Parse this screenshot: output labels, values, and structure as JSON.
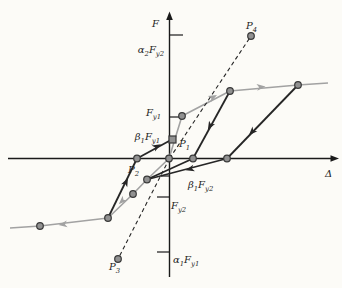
{
  "labels": {
    "axis_f": "F",
    "axis_delta": "Δ",
    "alpha2_fy2": {
      "a": "α",
      "as": "2",
      "b": "F",
      "bs": "y2"
    },
    "fy1": {
      "b": "F",
      "bs": "y1"
    },
    "beta1_fy1": {
      "a": "β",
      "as": "1",
      "b": "F",
      "bs": "y1"
    },
    "beta1_fy2": {
      "a": "β",
      "as": "1",
      "b": "F",
      "bs": "y2"
    },
    "fy2": {
      "b": "F",
      "bs": "y2"
    },
    "alpha1_fy1": {
      "a": "α",
      "as": "1",
      "b": "F",
      "bs": "y1"
    },
    "p1": {
      "main": "P",
      "sub": "1"
    },
    "p2": {
      "main": "P",
      "sub": "2"
    },
    "p3": {
      "main": "P",
      "sub": "3"
    },
    "p4": {
      "main": "P",
      "sub": "4"
    }
  },
  "figure": {
    "background": "#fcfbf7",
    "axis_color": "#1a1a1a",
    "curve_dark_color": "#262626",
    "curve_gray_color": "#a2a2a2",
    "marker_fill": "#919191",
    "marker_stroke": "#383838",
    "x_axis": {
      "x1": 8,
      "y1": 158.5,
      "x2": 332,
      "y2": 158.5,
      "head": "M339,158.5 L330.5,155.2 L330.5,161.8 Z"
    },
    "y_axis": {
      "x1": 169.5,
      "y1": 277,
      "x2": 169.5,
      "y2": 20,
      "head": "M169.5,11.5 L166.2,20 L172.8,20 Z"
    },
    "ticks": [
      [
        169.5,
        35,
        183,
        35
      ],
      [
        169.5,
        117,
        180,
        117
      ],
      [
        169.5,
        138,
        175.5,
        138
      ],
      [
        161,
        176,
        169.5,
        176
      ],
      [
        157,
        197,
        169.5,
        197
      ],
      [
        157,
        252,
        169.5,
        252
      ]
    ],
    "polylines": [
      {
        "name": "backbone-curve",
        "color": "gray",
        "width": 1.6,
        "dash": "",
        "points": [
          [
            10,
            228
          ],
          [
            40,
            226
          ],
          [
            108,
            218
          ],
          [
            133,
            194
          ],
          [
            147,
            179.5
          ],
          [
            169,
            158.5
          ],
          [
            182,
            116
          ],
          [
            230,
            91
          ],
          [
            298,
            85
          ],
          [
            328,
            83
          ]
        ]
      },
      {
        "name": "secant-line-positive",
        "color": "dark",
        "width": 1.1,
        "dash": "4 3",
        "points": [
          [
            169.5,
            158.5
          ],
          [
            251,
            36
          ]
        ]
      },
      {
        "name": "secant-line-negative",
        "color": "dark",
        "width": 1.1,
        "dash": "4 3",
        "points": [
          [
            169.5,
            158.5
          ],
          [
            118,
            259
          ]
        ]
      },
      {
        "name": "unload-path-1",
        "color": "dark",
        "width": 1.8,
        "dash": "",
        "points": [
          [
            230,
            91
          ],
          [
            193,
            158.5
          ]
        ]
      },
      {
        "name": "reverse-path-1",
        "color": "dark",
        "width": 1.8,
        "dash": "",
        "points": [
          [
            193,
            158.5
          ],
          [
            147,
            179.5
          ]
        ]
      },
      {
        "name": "unload-path-2",
        "color": "dark",
        "width": 1.8,
        "dash": "",
        "points": [
          [
            298,
            85
          ],
          [
            227,
            158.5
          ]
        ]
      },
      {
        "name": "reverse-path-2",
        "color": "dark",
        "width": 1.8,
        "dash": "",
        "points": [
          [
            227,
            158.5
          ],
          [
            147,
            179.5
          ]
        ]
      },
      {
        "name": "reload-path-negative",
        "color": "dark",
        "width": 1.8,
        "dash": "",
        "points": [
          [
            108,
            218
          ],
          [
            137,
            158.5
          ]
        ]
      },
      {
        "name": "reload-path-to-p1",
        "color": "dark",
        "width": 1.8,
        "dash": "",
        "points": [
          [
            137,
            158.5
          ],
          [
            170,
            140.5
          ]
        ]
      }
    ],
    "arrows": [
      {
        "name": "backbone-arrow-left",
        "x": 63,
        "y": 224.5,
        "angle": 173,
        "color": "gray"
      },
      {
        "name": "backbone-arrow-downleft",
        "x": 122,
        "y": 201,
        "angle": 136,
        "color": "gray"
      },
      {
        "name": "backbone-arrow-upright",
        "x": 213,
        "y": 97,
        "angle": -28,
        "color": "gray"
      },
      {
        "name": "backbone-arrow-right",
        "x": 261,
        "y": 87,
        "angle": -6,
        "color": "gray"
      },
      {
        "name": "reload-arrow-up",
        "x": 126,
        "y": 182,
        "angle": -64,
        "color": "dark"
      },
      {
        "name": "reload-arrow-to-p1",
        "x": 157,
        "y": 146.5,
        "angle": -29,
        "color": "dark"
      },
      {
        "name": "unload-arrow-1",
        "x": 210,
        "y": 126,
        "angle": 119,
        "color": "dark"
      },
      {
        "name": "unload-arrow-2",
        "x": 252,
        "y": 132,
        "angle": 134,
        "color": "dark"
      },
      {
        "name": "reverse-arrow-left",
        "x": 190,
        "y": 169,
        "angle": 165,
        "color": "dark"
      }
    ],
    "markers": [
      {
        "name": "node-backbone-left",
        "shape": "circle",
        "x": 40,
        "y": 226
      },
      {
        "name": "node-backbone-bend-neg",
        "shape": "circle",
        "x": 108,
        "y": 218
      },
      {
        "name": "node-backbone-neg-mid",
        "shape": "circle",
        "x": 133,
        "y": 194
      },
      {
        "name": "node-pinch-point",
        "shape": "circle",
        "x": 147,
        "y": 179.5
      },
      {
        "name": "point-p2",
        "shape": "circle",
        "x": 137,
        "y": 158.5
      },
      {
        "name": "point-origin",
        "shape": "circle",
        "x": 169,
        "y": 158.5
      },
      {
        "name": "node-axis-crossing-1",
        "shape": "circle",
        "x": 193,
        "y": 158.5
      },
      {
        "name": "node-axis-crossing-2",
        "shape": "circle",
        "x": 227,
        "y": 158.5
      },
      {
        "name": "node-yield-fy1",
        "shape": "circle",
        "x": 182,
        "y": 116
      },
      {
        "name": "node-peak-1",
        "shape": "circle",
        "x": 230,
        "y": 91
      },
      {
        "name": "node-peak-2",
        "shape": "circle",
        "x": 298,
        "y": 85
      },
      {
        "name": "point-p4",
        "shape": "circle",
        "x": 251,
        "y": 36
      },
      {
        "name": "point-p3",
        "shape": "circle",
        "x": 118,
        "y": 259
      },
      {
        "name": "point-p1",
        "shape": "square",
        "x": 172.5,
        "y": 139.5
      }
    ]
  }
}
